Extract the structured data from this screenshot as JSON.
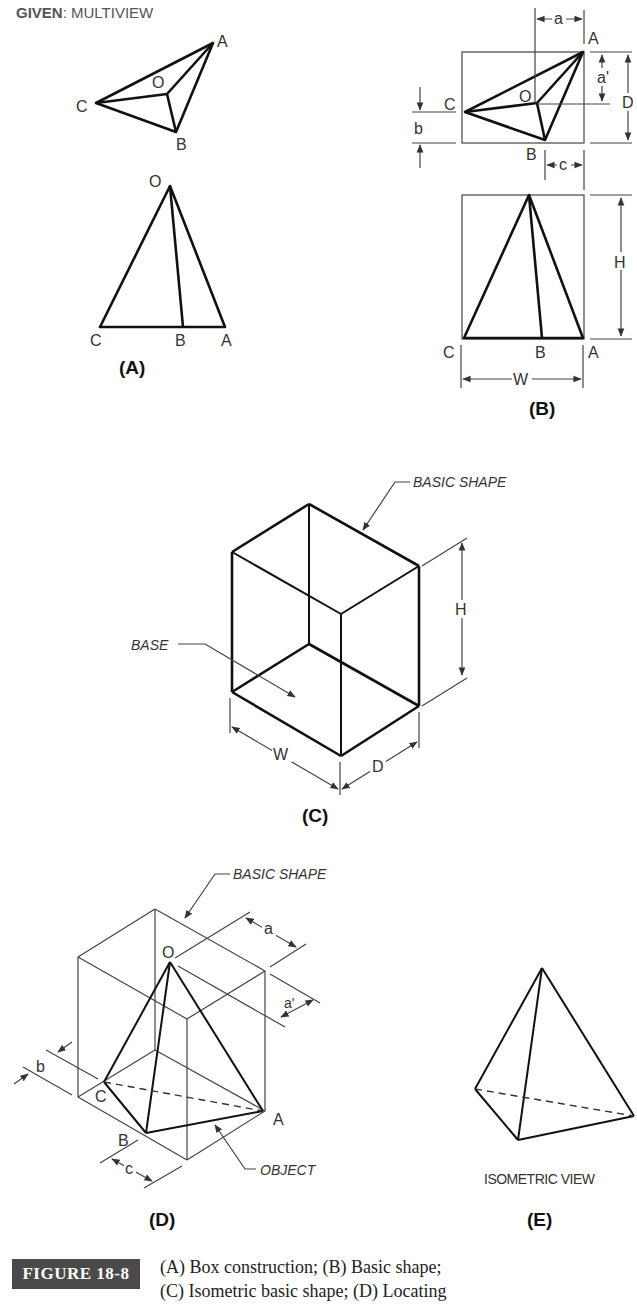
{
  "header": {
    "given_bold": "GIVEN",
    "given_rest": ": MULTIVIEW"
  },
  "panels": {
    "A": {
      "label": "(A)",
      "top_view_points": {
        "A": "A",
        "B": "B",
        "C": "C",
        "O": "O"
      },
      "front_view_points": {
        "O": "O",
        "C": "C",
        "B": "B",
        "A": "A"
      }
    },
    "B": {
      "label": "(B)",
      "top_view_points": {
        "A": "A",
        "B": "B",
        "C": "C",
        "O": "O"
      },
      "front_view_points": {
        "C": "C",
        "B": "B",
        "A": "A"
      },
      "dimensions": {
        "a": "a",
        "a_prime": "a'",
        "b": "b",
        "c": "c",
        "D": "D",
        "H": "H",
        "W": "W"
      }
    },
    "C": {
      "label": "(C)",
      "callout_basic_shape": "BASIC SHAPE",
      "callout_base": "BASE",
      "dimensions": {
        "H": "H",
        "W": "W",
        "D": "D"
      }
    },
    "D": {
      "label": "(D)",
      "callout_basic_shape": "BASIC SHAPE",
      "callout_object": "OBJECT",
      "points": {
        "O": "O",
        "A": "A",
        "B": "B",
        "C": "C"
      },
      "dimensions": {
        "a": "a",
        "a_prime": "a'",
        "b": "b",
        "c": "c"
      }
    },
    "E": {
      "label": "(E)",
      "caption": "ISOMETRIC VIEW"
    }
  },
  "figure_caption": {
    "number": "FIGURE 18-8",
    "line1": "(A) Box construction; (B) Basic shape;",
    "line2": "(C) Isometric basic shape; (D) Locating"
  },
  "colors": {
    "caption_box_bg": "#4a4a4a",
    "caption_box_text": "#ffffff",
    "line": "#111111",
    "label_text": "#333333"
  }
}
